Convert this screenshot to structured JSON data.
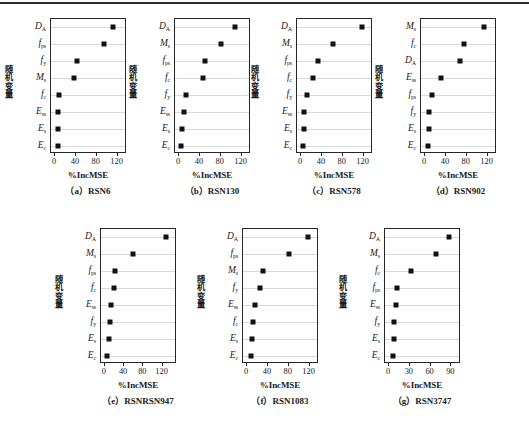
{
  "figure": {
    "axis_y_title": "随机变量",
    "axis_x_title": "%IncMSE",
    "marker_color": "#111111",
    "grid_color": "#d9d9d9",
    "axis_color": "#262626"
  },
  "chart_data": [
    {
      "type": "scatter",
      "panel": "a",
      "caption": "（a）RSN6",
      "title": "RSN6",
      "xlabel": "%IncMSE",
      "ylabel": "随机变量",
      "xlim": [
        -8,
        138
      ],
      "xticks": [
        0,
        40,
        80,
        120
      ],
      "xtick_labels": [
        "0",
        "40",
        "80",
        "120"
      ],
      "grid": true,
      "legend": "none",
      "categories": [
        "D_A",
        "f_ps",
        "f_y",
        "M_s",
        "f_c",
        "E_ss",
        "E_s",
        "E_c"
      ],
      "category_labels": [
        {
          "base": "D",
          "sub": "A"
        },
        {
          "base": "f",
          "sub": "ps"
        },
        {
          "base": "f",
          "sub": "y"
        },
        {
          "base": "M",
          "sub": "s"
        },
        {
          "base": "f",
          "sub": "c"
        },
        {
          "base": "E",
          "sub": "ss"
        },
        {
          "base": "E",
          "sub": "s"
        },
        {
          "base": "E",
          "sub": "c"
        }
      ],
      "values": [
        112,
        94,
        41,
        36,
        8,
        6,
        6,
        5
      ]
    },
    {
      "type": "scatter",
      "panel": "b",
      "caption": "（b）RSN130",
      "title": "RSN130",
      "xlabel": "%IncMSE",
      "ylabel": "随机变量",
      "xlim": [
        -8,
        138
      ],
      "xticks": [
        0,
        40,
        80,
        120
      ],
      "xtick_labels": [
        "0",
        "40",
        "80",
        "120"
      ],
      "grid": true,
      "legend": "none",
      "categories": [
        "D_A",
        "M_s",
        "f_ps",
        "f_c",
        "f_y",
        "E_ss",
        "E_s",
        "E_c"
      ],
      "category_labels": [
        {
          "base": "D",
          "sub": "A"
        },
        {
          "base": "M",
          "sub": "s"
        },
        {
          "base": "f",
          "sub": "ps"
        },
        {
          "base": "f",
          "sub": "c"
        },
        {
          "base": "f",
          "sub": "y"
        },
        {
          "base": "E",
          "sub": "ss"
        },
        {
          "base": "E",
          "sub": "s"
        },
        {
          "base": "E",
          "sub": "c"
        }
      ],
      "values": [
        107,
        81,
        49,
        45,
        14,
        9,
        5,
        4
      ]
    },
    {
      "type": "scatter",
      "panel": "c",
      "caption": "（c）RSN578",
      "title": "RSN578",
      "xlabel": "%IncMSE",
      "ylabel": "随机变量",
      "xlim": [
        -8,
        138
      ],
      "xticks": [
        0,
        40,
        80,
        120
      ],
      "xtick_labels": [
        "0",
        "40",
        "80",
        "120"
      ],
      "grid": true,
      "legend": "none",
      "categories": [
        "D_A",
        "M_s",
        "f_ps",
        "f_c",
        "f_y",
        "E_ss",
        "E_s",
        "E_c"
      ],
      "category_labels": [
        {
          "base": "D",
          "sub": "A"
        },
        {
          "base": "M",
          "sub": "s"
        },
        {
          "base": "f",
          "sub": "ps"
        },
        {
          "base": "f",
          "sub": "c"
        },
        {
          "base": "f",
          "sub": "y"
        },
        {
          "base": "E",
          "sub": "ss"
        },
        {
          "base": "E",
          "sub": "s"
        },
        {
          "base": "E",
          "sub": "c"
        }
      ],
      "values": [
        117,
        61,
        32,
        22,
        11,
        5,
        5,
        3
      ]
    },
    {
      "type": "scatter",
      "panel": "d",
      "caption": "（d）RSN902",
      "title": "RSN902",
      "xlabel": "%IncMSE",
      "ylabel": "随机变量",
      "xlim": [
        -8,
        138
      ],
      "xticks": [
        0,
        40,
        80,
        120
      ],
      "xtick_labels": [
        "0",
        "40",
        "80",
        "120"
      ],
      "grid": true,
      "legend": "none",
      "categories": [
        "M_s",
        "f_c",
        "D_A",
        "E_ss",
        "f_ps",
        "f_y",
        "E_s",
        "E_c"
      ],
      "category_labels": [
        {
          "base": "M",
          "sub": "s"
        },
        {
          "base": "f",
          "sub": "c"
        },
        {
          "base": "D",
          "sub": "A"
        },
        {
          "base": "E",
          "sub": "ss"
        },
        {
          "base": "f",
          "sub": "ps"
        },
        {
          "base": "f",
          "sub": "y"
        },
        {
          "base": "E",
          "sub": "s"
        },
        {
          "base": "E",
          "sub": "c"
        }
      ],
      "values": [
        113,
        74,
        67,
        30,
        13,
        8,
        8,
        6
      ]
    },
    {
      "type": "scatter",
      "panel": "e",
      "caption": "（e）RSNRSN947",
      "title": "RSNRSN947",
      "xlabel": "%IncMSE",
      "ylabel": "随机变量",
      "xlim": [
        -8,
        150
      ],
      "xticks": [
        0,
        40,
        80,
        120
      ],
      "xtick_labels": [
        "0",
        "40",
        "80",
        "120"
      ],
      "grid": true,
      "legend": "none",
      "categories": [
        "D_A",
        "M_s",
        "f_ps",
        "f_c",
        "E_ss",
        "f_y",
        "E_s",
        "E_c"
      ],
      "category_labels": [
        {
          "base": "D",
          "sub": "A"
        },
        {
          "base": "M",
          "sub": "s"
        },
        {
          "base": "f",
          "sub": "ps"
        },
        {
          "base": "f",
          "sub": "c"
        },
        {
          "base": "E",
          "sub": "ss"
        },
        {
          "base": "f",
          "sub": "y"
        },
        {
          "base": "E",
          "sub": "s"
        },
        {
          "base": "E",
          "sub": "c"
        }
      ],
      "values": [
        128,
        58,
        22,
        18,
        13,
        11,
        8,
        4
      ]
    },
    {
      "type": "scatter",
      "panel": "f",
      "caption": "（f）RSN1083",
      "title": "RSN1083",
      "xlabel": "%IncMSE",
      "ylabel": "随机变量",
      "xlim": [
        -8,
        138
      ],
      "xticks": [
        0,
        40,
        80,
        120
      ],
      "xtick_labels": [
        "0",
        "40",
        "80",
        "120"
      ],
      "grid": true,
      "legend": "none",
      "categories": [
        "D_A",
        "f_ps",
        "M_s",
        "f_y",
        "E_ss",
        "f_c",
        "E_s",
        "E_c"
      ],
      "category_labels": [
        {
          "base": "D",
          "sub": "A"
        },
        {
          "base": "f",
          "sub": "ps"
        },
        {
          "base": "M",
          "sub": "s"
        },
        {
          "base": "f",
          "sub": "y"
        },
        {
          "base": "E",
          "sub": "ss"
        },
        {
          "base": "f",
          "sub": "c"
        },
        {
          "base": "E",
          "sub": "s"
        },
        {
          "base": "E",
          "sub": "c"
        }
      ],
      "values": [
        117,
        80,
        30,
        24,
        15,
        12,
        10,
        8
      ]
    },
    {
      "type": "scatter",
      "panel": "g",
      "caption": "（g）RSN3747",
      "title": "RSN3747",
      "xlabel": "%IncMSE",
      "ylabel": "随机变量",
      "xlim": [
        -6,
        104
      ],
      "xticks": [
        0,
        30,
        60,
        90
      ],
      "xtick_labels": [
        "0",
        "30",
        "60",
        "90"
      ],
      "grid": true,
      "legend": "none",
      "categories": [
        "D_A",
        "M_s",
        "f_c",
        "f_ps",
        "E_ss",
        "f_y",
        "E_s",
        "E_c"
      ],
      "category_labels": [
        {
          "base": "D",
          "sub": "A"
        },
        {
          "base": "M",
          "sub": "s"
        },
        {
          "base": "f",
          "sub": "c"
        },
        {
          "base": "f",
          "sub": "ps"
        },
        {
          "base": "E",
          "sub": "ss"
        },
        {
          "base": "f",
          "sub": "y"
        },
        {
          "base": "E",
          "sub": "s"
        },
        {
          "base": "E",
          "sub": "c"
        }
      ],
      "values": [
        87,
        68,
        32,
        11,
        10,
        7,
        7,
        5
      ]
    }
  ],
  "layout": {
    "panels": [
      {
        "id": "a",
        "left": 10,
        "top": 18,
        "box_left": 50,
        "box_top": 18,
        "box_w": 76,
        "box_h": 135
      },
      {
        "id": "b",
        "left": 132,
        "top": 18,
        "box_left": 174,
        "box_top": 18,
        "box_w": 76,
        "box_h": 135
      },
      {
        "id": "c",
        "left": 256,
        "top": 18,
        "box_left": 296,
        "box_top": 18,
        "box_w": 76,
        "box_h": 135
      },
      {
        "id": "d",
        "left": 380,
        "top": 18,
        "box_left": 420,
        "box_top": 18,
        "box_w": 76,
        "box_h": 135
      },
      {
        "id": "e",
        "left": 58,
        "top": 228,
        "box_left": 100,
        "box_top": 228,
        "box_w": 76,
        "box_h": 135
      },
      {
        "id": "f",
        "left": 200,
        "top": 228,
        "box_left": 242,
        "box_top": 228,
        "box_w": 76,
        "box_h": 135
      },
      {
        "id": "g",
        "left": 342,
        "top": 228,
        "box_left": 384,
        "box_top": 228,
        "box_w": 76,
        "box_h": 135
      }
    ]
  }
}
